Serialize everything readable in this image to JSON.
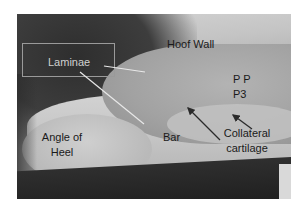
{
  "figure": {
    "type": "labeled anatomical photograph",
    "colors": {
      "dark_label": "#1a1a1a",
      "light_label": "#d0d0d0",
      "pointer_light": "#e8e8e8",
      "arrow_dark": "#2a2a2a",
      "box_border": "#9a9a9a"
    },
    "labels": {
      "hoof_wall": "Hoof Wall",
      "laminae": "Laminae",
      "pp": "P P",
      "p3": "P3",
      "angle_of_heel_line1": "Angle of",
      "angle_of_heel_line2": "Heel",
      "bar": "Bar",
      "collateral_cartilage_line1": "Collateral",
      "collateral_cartilage_line2": "cartilage"
    }
  }
}
